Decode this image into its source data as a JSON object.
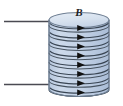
{
  "figure": {
    "background_color": "#ffffff",
    "width": 123,
    "height": 106
  },
  "labels": {
    "magnetic_field": "B"
  },
  "cylinder": {
    "name": "solenoid-core",
    "fill_color": "#c3d2e6",
    "top_face_fill": "#dde6f1",
    "outline_color": "#6f7f93",
    "left_x": 49,
    "right_x": 109,
    "top_y": 13,
    "bottom_y": 96,
    "ellipse_ry": 7
  },
  "coil": {
    "name": "wire-coil",
    "turns": 8,
    "stroke_color": "#3a4654",
    "arrow_color": "#111111",
    "arrow_direction": "right",
    "first_turn_y": 25,
    "turn_spacing": 9.2
  },
  "leads": [
    {
      "name": "top-lead-wire",
      "label": "top terminal lead",
      "x1": 4,
      "y1": 21,
      "x2": 52,
      "y2": 21,
      "color": "#4a4a52"
    },
    {
      "name": "bottom-lead-wire",
      "label": "bottom terminal lead",
      "x1": 4,
      "y1": 84,
      "x2": 52,
      "y2": 84,
      "color": "#4a4a52"
    }
  ],
  "colors": {
    "cylinder_body": "#c3d2e6",
    "cylinder_top": "#dde6f1",
    "outline": "#6f7f93",
    "coil_line": "#3a4654",
    "arrow": "#111111",
    "lead_wire": "#4a4a52",
    "label_text": "#1c1c22"
  }
}
